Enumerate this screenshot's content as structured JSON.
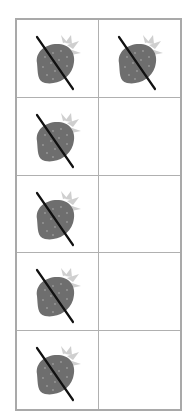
{
  "diagram": {
    "type": "ten-frame",
    "columns": 2,
    "rows": 5,
    "cells": [
      {
        "item": "strawberry",
        "crossed_out": true
      },
      {
        "item": "strawberry",
        "crossed_out": true
      },
      {
        "item": "strawberry",
        "crossed_out": true
      },
      {
        "item": null,
        "crossed_out": false
      },
      {
        "item": "strawberry",
        "crossed_out": true
      },
      {
        "item": null,
        "crossed_out": false
      },
      {
        "item": "strawberry",
        "crossed_out": true
      },
      {
        "item": null,
        "crossed_out": false
      },
      {
        "item": "strawberry",
        "crossed_out": true
      },
      {
        "item": null,
        "crossed_out": false
      }
    ],
    "counts": {
      "strawberries": 6,
      "crossed_out": 6,
      "empty": 4
    },
    "colors": {
      "border": "#a9a9a9",
      "berry": "#6b6b6b",
      "leaf": "#c8c8c8",
      "slash": "#111111"
    }
  }
}
